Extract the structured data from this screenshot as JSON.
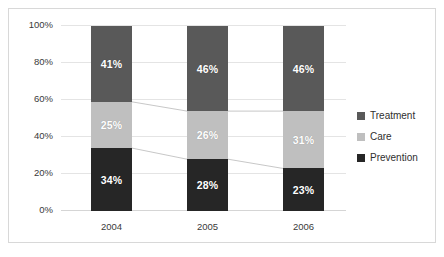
{
  "chart_data": {
    "type": "bar",
    "subtype": "stacked-percent",
    "title": "",
    "xlabel": "",
    "ylabel": "",
    "categories": [
      "2004",
      "2005",
      "2006"
    ],
    "series": [
      {
        "name": "Prevention",
        "color": "#262626",
        "values": [
          34,
          28,
          23
        ],
        "labels": [
          "34%",
          "28%",
          "23%"
        ]
      },
      {
        "name": "Care",
        "color": "#BFBFBF",
        "values": [
          25,
          26,
          31
        ],
        "labels": [
          "25%",
          "26%",
          "31%"
        ]
      },
      {
        "name": "Treatment",
        "color": "#595959",
        "values": [
          41,
          46,
          46
        ],
        "labels": [
          "41%",
          "46%",
          "46%"
        ]
      }
    ],
    "ylim": [
      0,
      100
    ],
    "yticks": [
      0,
      20,
      40,
      60,
      80,
      100
    ],
    "ytick_labels": [
      "0%",
      "20%",
      "40%",
      "60%",
      "80%",
      "100%"
    ],
    "grid": true,
    "legend_position": "right",
    "legend_order": [
      "Treatment",
      "Care",
      "Prevention"
    ],
    "connectors": true
  },
  "legend": {
    "items": [
      {
        "label": "Treatment",
        "color": "#595959"
      },
      {
        "label": "Care",
        "color": "#BFBFBF"
      },
      {
        "label": "Prevention",
        "color": "#262626"
      }
    ]
  }
}
